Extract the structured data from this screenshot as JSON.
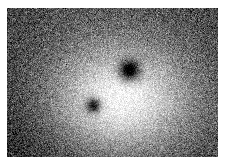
{
  "figure": {
    "caption": "",
    "image_type": "grayscale-raster",
    "colormap": "grayscale",
    "page_background": "#ffffff",
    "plate": {
      "left_px": 7,
      "top_px": 8,
      "width_px": 211,
      "height_px": 149,
      "border": "none"
    },
    "noise": {
      "type": "speckle",
      "grain_size_px": 1,
      "amplitude": 58,
      "description": "heavy per-pixel salt-and-pepper grain across entire plate"
    },
    "background": {
      "base_gray": 96,
      "corner_gray": 78,
      "darkest_corner": "bottom-left",
      "corner_gray_bottom_left": 62
    },
    "features": [
      {
        "name": "bright-halo",
        "kind": "bright-diffuse-blob",
        "center_x_px": 113,
        "center_y_px": 92,
        "radius_x_px": 68,
        "radius_y_px": 52,
        "peak_gray": 252,
        "falloff": "gaussian"
      },
      {
        "name": "dark-spot-upper",
        "kind": "dark-compact-source",
        "center_x_px": 122,
        "center_y_px": 62,
        "radius_px": 11,
        "core_gray": 18,
        "falloff": "gaussian",
        "relative_size": "larger"
      },
      {
        "name": "dark-spot-lower-left",
        "kind": "dark-compact-source",
        "center_x_px": 86,
        "center_y_px": 97,
        "radius_px": 8,
        "core_gray": 34,
        "falloff": "gaussian",
        "relative_size": "smaller"
      }
    ],
    "axes": {
      "visible": false,
      "tick_labels": [],
      "axis_labels": []
    },
    "legend": {
      "visible": false,
      "entries": []
    },
    "colorbar": {
      "visible": false
    },
    "annotations": []
  },
  "chart_data": {
    "type": "heatmap",
    "xlabel": "",
    "ylabel": "",
    "colormap": "gray",
    "grid": false,
    "legend_position": "none",
    "xlim": [
      0,
      211
    ],
    "ylim": [
      0,
      149
    ],
    "value_range": [
      0,
      255
    ],
    "tick_labels_x": [],
    "tick_labels_y": [],
    "annotations": [],
    "components": [
      {
        "name": "background-gradient",
        "role": "base",
        "value": 96,
        "corner_value": 70
      },
      {
        "name": "bright-halo",
        "role": "positive-peak",
        "x": 113,
        "y": 92,
        "sigma_x": 44,
        "sigma_y": 34,
        "peak_value": 255
      },
      {
        "name": "dark-spot-upper",
        "role": "negative-peak",
        "x": 122,
        "y": 62,
        "sigma": 7,
        "peak_value": 14
      },
      {
        "name": "dark-spot-lower-left",
        "role": "negative-peak",
        "x": 86,
        "y": 97,
        "sigma": 5,
        "peak_value": 30
      }
    ],
    "noise_sigma": 30
  }
}
